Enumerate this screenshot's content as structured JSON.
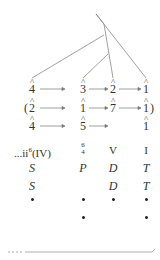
{
  "tree": {
    "description": "branching tree connecting scale-degree columns"
  },
  "rows": [
    {
      "name": "melody-upper",
      "cells": [
        "4",
        "3",
        "2",
        "1"
      ],
      "arrows": [
        "4-3",
        "3-2",
        "2-1"
      ]
    },
    {
      "name": "melody-alt",
      "open_paren": "(",
      "cells": [
        "2",
        "1",
        "7",
        "1"
      ],
      "close_paren": ")",
      "arrows": [
        "2-1",
        "1-7",
        "7-1"
      ]
    },
    {
      "name": "bass",
      "cells": [
        "4",
        "5",
        "",
        "1"
      ],
      "arrows": [
        "4-5",
        "5-"
      ]
    }
  ],
  "hat_symbol": "^",
  "harmony": {
    "col1": "...ii⁶(IV)",
    "col1_prefix": "...",
    "col1_main": "ii",
    "col1_sup": "6",
    "col1_paren": "(IV)",
    "col2_top": "6",
    "col2_bottom": "4",
    "col3": "V",
    "col4": "I"
  },
  "functions_row1": [
    "S",
    "P",
    "D",
    "T"
  ],
  "functions_row2": [
    "S",
    "",
    "D",
    "T"
  ],
  "dots_row1": [
    true,
    true,
    true,
    true
  ],
  "dots_row2": [
    false,
    true,
    false,
    true
  ],
  "colors": {
    "ink": "#333333",
    "line": "#777777"
  }
}
